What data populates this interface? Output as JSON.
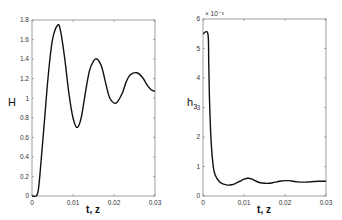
{
  "chart_data": [
    {
      "type": "line",
      "title": "",
      "xlabel": "t, z",
      "ylabel": "H",
      "xlim": [
        0,
        0.03
      ],
      "ylim": [
        0,
        1.8
      ],
      "xticks": [
        "0",
        "0.01",
        "0.02",
        "0.03"
      ],
      "yticks": [
        "0",
        "0.2",
        "0.4",
        "0.6",
        "0.8",
        "1",
        "1.2",
        "1.4",
        "1.6",
        "1.8"
      ],
      "grid": false,
      "series": [
        {
          "name": "H",
          "x": [
            0,
            0.001,
            0.0015,
            0.002,
            0.003,
            0.004,
            0.005,
            0.0063,
            0.007,
            0.008,
            0.009,
            0.01,
            0.011,
            0.012,
            0.013,
            0.014,
            0.015,
            0.0159,
            0.017,
            0.018,
            0.019,
            0.0205,
            0.022,
            0.023,
            0.024,
            0.0256,
            0.027,
            0.028,
            0.029,
            0.03
          ],
          "values": [
            0,
            0,
            0.05,
            0.25,
            0.75,
            1.25,
            1.6,
            1.75,
            1.68,
            1.4,
            1.05,
            0.8,
            0.7,
            0.8,
            1.05,
            1.28,
            1.38,
            1.4,
            1.32,
            1.15,
            1.0,
            0.95,
            1.05,
            1.17,
            1.24,
            1.26,
            1.21,
            1.14,
            1.09,
            1.07
          ]
        }
      ]
    },
    {
      "type": "line",
      "title": "",
      "xlabel": "t, z",
      "ylabel": "h3",
      "ylabel_display": "h₃",
      "y_multiplier": "× 10⁻³",
      "xlim": [
        0,
        0.03
      ],
      "ylim": [
        0,
        6
      ],
      "xticks": [
        "0",
        "0.01",
        "0.02",
        "0.03"
      ],
      "yticks": [
        "0",
        "1",
        "2",
        "3",
        "4",
        "5",
        "6"
      ],
      "grid": false,
      "series": [
        {
          "name": "h3",
          "x": [
            0,
            0.0012,
            0.0014,
            0.0016,
            0.002,
            0.0025,
            0.003,
            0.004,
            0.005,
            0.006,
            0.007,
            0.008,
            0.009,
            0.01,
            0.011,
            0.012,
            0.013,
            0.014,
            0.015,
            0.016,
            0.017,
            0.018,
            0.019,
            0.02,
            0.021,
            0.022,
            0.023,
            0.024,
            0.025,
            0.026,
            0.027,
            0.028,
            0.029,
            0.03
          ],
          "values": [
            5.5,
            5.5,
            4.5,
            3.2,
            1.8,
            1.0,
            0.7,
            0.48,
            0.4,
            0.37,
            0.38,
            0.43,
            0.5,
            0.57,
            0.6,
            0.57,
            0.5,
            0.45,
            0.43,
            0.43,
            0.45,
            0.48,
            0.51,
            0.52,
            0.52,
            0.5,
            0.48,
            0.47,
            0.47,
            0.48,
            0.49,
            0.5,
            0.5,
            0.5
          ]
        }
      ]
    }
  ],
  "left_plot": {
    "ylabel": "H",
    "xlabel": "t, z",
    "yticks": [
      "0",
      "0.2",
      "0.4",
      "0.6",
      "0.8",
      "1",
      "1.2",
      "1.4",
      "1.6",
      "1.8"
    ],
    "xticks": [
      "0",
      "0.01",
      "0.02",
      "0.03"
    ]
  },
  "right_plot": {
    "ylabel_main": "h",
    "ylabel_sub": "3",
    "xlabel": "t, z",
    "multiplier": "× 10⁻³",
    "yticks": [
      "0",
      "1",
      "2",
      "3",
      "4",
      "5",
      "6"
    ],
    "xticks": [
      "0",
      "0.01",
      "0.02",
      "0.03"
    ]
  }
}
